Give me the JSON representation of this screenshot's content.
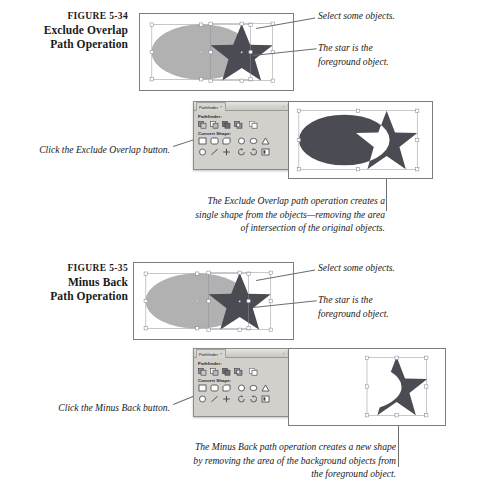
{
  "figures": [
    {
      "number": "FIGURE 5-34",
      "title_line1": "Exclude Overlap",
      "title_line2": "Path Operation",
      "callout_select": "Select some objects.",
      "callout_star_line1": "The star is the",
      "callout_star_line2": "foreground object.",
      "click_instruction": "Click the Exclude Overlap button.",
      "description_line1": "The Exclude Overlap path operation creates a",
      "description_line2": "single shape from the objects—removing the area",
      "description_line3": "of intersection of the original objects."
    },
    {
      "number": "FIGURE 5-35",
      "title_line1": "Minus Back",
      "title_line2": "Path Operation",
      "callout_select": "Select some objects.",
      "callout_star_line1": "The star is the",
      "callout_star_line2": "foreground object.",
      "click_instruction": "Click the Minus Back button.",
      "description_line1": "The Minus Back path operation creates a new shape",
      "description_line2": "by removing the area of the background objects from",
      "description_line3": "the foreground object."
    }
  ],
  "pathfinder_panel": {
    "tab_label": "Pathfinder",
    "tab_close": "×",
    "minimize": "–",
    "close": "✕",
    "section_pathfinder": "Pathfinder:",
    "section_convert_shape": "Convert Shape:",
    "pathfinder_buttons": [
      "add-icon",
      "subtract-icon",
      "intersect-icon",
      "exclude-overlap-icon",
      "minus-back-icon"
    ],
    "convert_shape_buttons_row1": [
      "rectangle-icon",
      "rounded-rectangle-icon",
      "beveled-rectangle-icon",
      "inverse-rounded-rectangle-icon",
      "ellipse-icon",
      "triangle-icon"
    ],
    "convert_shape_buttons_row2": [
      "polygon-icon",
      "line-icon",
      "orthogonal-line-icon",
      "open-path-icon",
      "closed-path-icon",
      "reverse-path-icon"
    ]
  },
  "colors": {
    "ellipse_fill": "#b1b1b1",
    "star_fill": "#4b4b53",
    "result_fill": "#4b4b53",
    "panel_border": "#7d7d7d",
    "leader_line": "#6e6e6e",
    "selection_stroke": "#8e8e9a",
    "handle_fill": "#ffffff",
    "palette_bg": "#d2d0cb",
    "page_bg": "#ffffff"
  },
  "artwork": {
    "selection_handle_count": 8,
    "objects": [
      "ellipse",
      "star"
    ],
    "star_points": 5
  }
}
